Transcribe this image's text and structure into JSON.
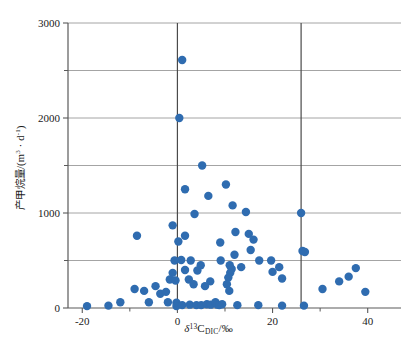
{
  "chart_data": {
    "type": "scatter",
    "title": "",
    "xlabel": "δ¹³C_DIC /‰",
    "ylabel": "产甲烷量/(m³ · d⁻¹)",
    "xlim": [
      -23,
      47
    ],
    "ylim": [
      0,
      3000
    ],
    "xticks": [
      -20,
      0,
      20,
      40
    ],
    "xtick_labels": [
      "-20",
      "0",
      "20",
      "40"
    ],
    "yticks": [
      0,
      1000,
      2000,
      3000
    ],
    "ytick_labels": [
      "0",
      "1000",
      "2000",
      "3000"
    ],
    "y_minor_ticks": [
      500,
      1500,
      2500
    ],
    "gridlines": {
      "horizontal_at": [
        500,
        1000,
        1500,
        2000,
        2500,
        3000
      ],
      "vertical_at": [
        0,
        26
      ]
    },
    "grid": true,
    "legend": "none",
    "marker_color": "#2f6cb0",
    "marker_size": 4.2,
    "points": [
      [
        1.0,
        2610
      ],
      [
        0.4,
        2000
      ],
      [
        5.2,
        1500
      ],
      [
        1.6,
        1250
      ],
      [
        6.5,
        1180
      ],
      [
        10.2,
        1300
      ],
      [
        3.6,
        990
      ],
      [
        11.6,
        1080
      ],
      [
        14.4,
        1010
      ],
      [
        26.0,
        1000
      ],
      [
        -1.0,
        870
      ],
      [
        12.2,
        800
      ],
      [
        15.0,
        780
      ],
      [
        1.6,
        760
      ],
      [
        9.0,
        690
      ],
      [
        16.0,
        720
      ],
      [
        -8.5,
        760
      ],
      [
        0.2,
        700
      ],
      [
        15.4,
        610
      ],
      [
        26.3,
        600
      ],
      [
        26.8,
        590
      ],
      [
        12.0,
        560
      ],
      [
        17.2,
        500
      ],
      [
        19.7,
        500
      ],
      [
        -0.6,
        500
      ],
      [
        0.8,
        505
      ],
      [
        2.8,
        500
      ],
      [
        9.1,
        500
      ],
      [
        4.9,
        450
      ],
      [
        21.4,
        430
      ],
      [
        20.0,
        380
      ],
      [
        1.6,
        400
      ],
      [
        4.2,
        395
      ],
      [
        -1.0,
        370
      ],
      [
        -1.6,
        300
      ],
      [
        -0.4,
        290
      ],
      [
        2.4,
        300
      ],
      [
        6.9,
        280
      ],
      [
        3.4,
        250
      ],
      [
        5.8,
        230
      ],
      [
        13.4,
        430
      ],
      [
        11.0,
        450
      ],
      [
        11.4,
        410
      ],
      [
        11.1,
        370
      ],
      [
        10.7,
        320
      ],
      [
        10.4,
        250
      ],
      [
        10.9,
        180
      ],
      [
        22.0,
        310
      ],
      [
        30.5,
        200
      ],
      [
        34.0,
        280
      ],
      [
        36.0,
        330
      ],
      [
        37.5,
        420
      ],
      [
        39.5,
        170
      ],
      [
        -12.0,
        60
      ],
      [
        -9.0,
        200
      ],
      [
        -7.0,
        180
      ],
      [
        -6.0,
        60
      ],
      [
        -4.6,
        230
      ],
      [
        -3.6,
        150
      ],
      [
        -2.4,
        170
      ],
      [
        -2.0,
        60
      ],
      [
        -0.2,
        55
      ],
      [
        -0.2,
        20
      ],
      [
        1.0,
        30
      ],
      [
        2.6,
        35
      ],
      [
        4.0,
        30
      ],
      [
        5.0,
        30
      ],
      [
        6.2,
        40
      ],
      [
        7.0,
        35
      ],
      [
        8.0,
        60
      ],
      [
        8.4,
        35
      ],
      [
        8.8,
        30
      ],
      [
        9.4,
        40
      ],
      [
        12.6,
        30
      ],
      [
        17.0,
        30
      ],
      [
        22.0,
        25
      ],
      [
        26.6,
        25
      ],
      [
        -14.5,
        25
      ],
      [
        -19.0,
        20
      ]
    ]
  },
  "axis_titles": {
    "x_delta": "δ",
    "x_sup": "13",
    "x_c": "C",
    "x_sub": "DIC",
    "x_units": "/‰",
    "y_prefix": "产甲烷量/(m",
    "y_sup": "3",
    "y_mid": " · d",
    "y_sup2": "-1",
    "y_suffix": ")"
  },
  "style": {
    "axis_color": "#5a5a5a",
    "grid_color": "#9a9a9a",
    "ref_line_color": "#4a4a4a",
    "background": "#ffffff",
    "text_color": "#1a1a1a"
  }
}
